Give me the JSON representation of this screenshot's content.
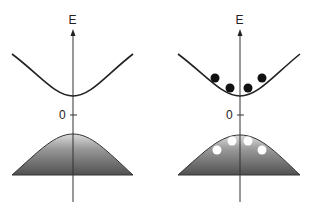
{
  "figure": {
    "colors": {
      "line": "#222222",
      "band_top": "#d8d8d8",
      "band_bottom": "#555555",
      "electron": "#111111",
      "hole": "#ffffff"
    },
    "panels": [
      {
        "id": "left",
        "axis_label": "E",
        "zero_label": "0",
        "electrons": 0,
        "holes": 0
      },
      {
        "id": "right",
        "axis_label": "E",
        "zero_label": "0",
        "electrons": 4,
        "holes": 4
      }
    ]
  }
}
